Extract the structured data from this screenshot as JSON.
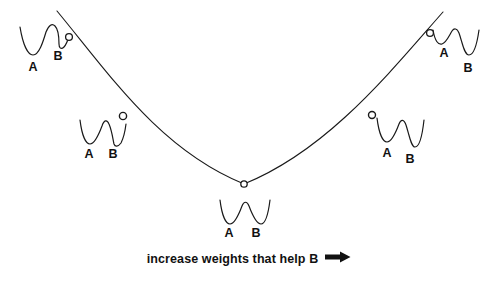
{
  "figure": {
    "background_color": "#ffffff",
    "stroke_color": "#1a1a1a",
    "caption": {
      "text": "increase weights that help B",
      "arrow_glyph": "right-arrow"
    },
    "error_curve": {
      "description": "U-shaped error surface",
      "start": [
        57,
        11
      ],
      "vertex": [
        244,
        184
      ],
      "end": [
        443,
        12
      ]
    },
    "markers": [
      {
        "id": "marker-1",
        "x": 69,
        "y": 37,
        "label": "top-left"
      },
      {
        "id": "marker-2",
        "x": 123,
        "y": 116,
        "label": "mid-left"
      },
      {
        "id": "marker-3",
        "x": 244,
        "y": 184,
        "label": "bottom-center"
      },
      {
        "id": "marker-4",
        "x": 372,
        "y": 115,
        "label": "mid-right"
      },
      {
        "id": "marker-5",
        "x": 430,
        "y": 33,
        "label": "top-right"
      }
    ],
    "wells": [
      {
        "id": "well-1",
        "position": [
          18,
          20
        ],
        "a_depth": "deep",
        "b_depth": "shallow",
        "a_label": "A",
        "b_label": "B",
        "a_label_pos": [
          33,
          71
        ],
        "b_label_pos": [
          58,
          60
        ]
      },
      {
        "id": "well-2",
        "position": [
          78,
          115
        ],
        "a_depth": "medium",
        "b_depth": "medium",
        "a_label": "A",
        "b_label": "B",
        "a_label_pos": [
          89,
          158
        ],
        "b_label_pos": [
          113,
          158
        ]
      },
      {
        "id": "well-3",
        "position": [
          218,
          198
        ],
        "a_depth": "medium",
        "b_depth": "medium",
        "a_label": "A",
        "b_label": "B",
        "a_label_pos": [
          229,
          236
        ],
        "b_label_pos": [
          255,
          236
        ]
      },
      {
        "id": "well-4",
        "position": [
          374,
          114
        ],
        "a_depth": "medium",
        "b_depth": "deep",
        "a_label": "A",
        "b_label": "B",
        "a_label_pos": [
          387,
          157
        ],
        "b_label_pos": [
          410,
          163
        ]
      },
      {
        "id": "well-5",
        "position": [
          430,
          25
        ],
        "a_depth": "shallow",
        "b_depth": "deep",
        "a_label": "A",
        "b_label": "B",
        "a_label_pos": [
          444,
          56
        ],
        "b_label_pos": [
          468,
          71
        ]
      }
    ]
  }
}
